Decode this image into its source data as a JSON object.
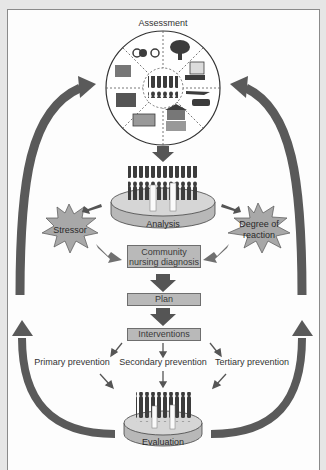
{
  "diagram": {
    "nodes": {
      "assessment": "Assessment",
      "analysis": "Analysis",
      "stressor": "Stressor",
      "degree_of_reaction_line1": "Degree of",
      "degree_of_reaction_line2": "reaction",
      "diagnosis_line1": "Community",
      "diagnosis_line2": "nursing diagnosis",
      "plan": "Plan",
      "interventions": "Interventions",
      "primary_prevention": "Primary prevention",
      "secondary_prevention": "Secondary prevention",
      "tertiary_prevention": "Tertiary prevention",
      "evaluation": "Evaluation"
    },
    "assessment_icons": [
      "bicycle-icon",
      "tree-icon",
      "document-icon",
      "airplane-car-icon",
      "government-building-icon",
      "ambulance-icon",
      "telephone-icon",
      "money-icon",
      "people-icon"
    ],
    "edges": [
      {
        "from": "Assessment",
        "to": "Analysis"
      },
      {
        "from": "Analysis",
        "to": "Stressor"
      },
      {
        "from": "Analysis",
        "to": "Degree of reaction"
      },
      {
        "from": "Stressor",
        "to": "Community nursing diagnosis"
      },
      {
        "from": "Degree of reaction",
        "to": "Community nursing diagnosis"
      },
      {
        "from": "Community nursing diagnosis",
        "to": "Plan"
      },
      {
        "from": "Plan",
        "to": "Interventions"
      },
      {
        "from": "Interventions",
        "to": "Primary prevention"
      },
      {
        "from": "Interventions",
        "to": "Secondary prevention"
      },
      {
        "from": "Interventions",
        "to": "Tertiary prevention"
      },
      {
        "from": "Primary prevention",
        "to": "Evaluation"
      },
      {
        "from": "Secondary prevention",
        "to": "Evaluation"
      },
      {
        "from": "Tertiary prevention",
        "to": "Evaluation"
      },
      {
        "from": "Evaluation",
        "to": "Assessment",
        "label": "feedback loop (left and right)"
      }
    ],
    "colors": {
      "arrow": "#555555",
      "box_fill": "#b9b9b9",
      "star_fill": "#a8a8a8",
      "disc_fill": "#c8c8c8",
      "people": "#3c3c3c",
      "background": "#fdfdfd"
    }
  }
}
